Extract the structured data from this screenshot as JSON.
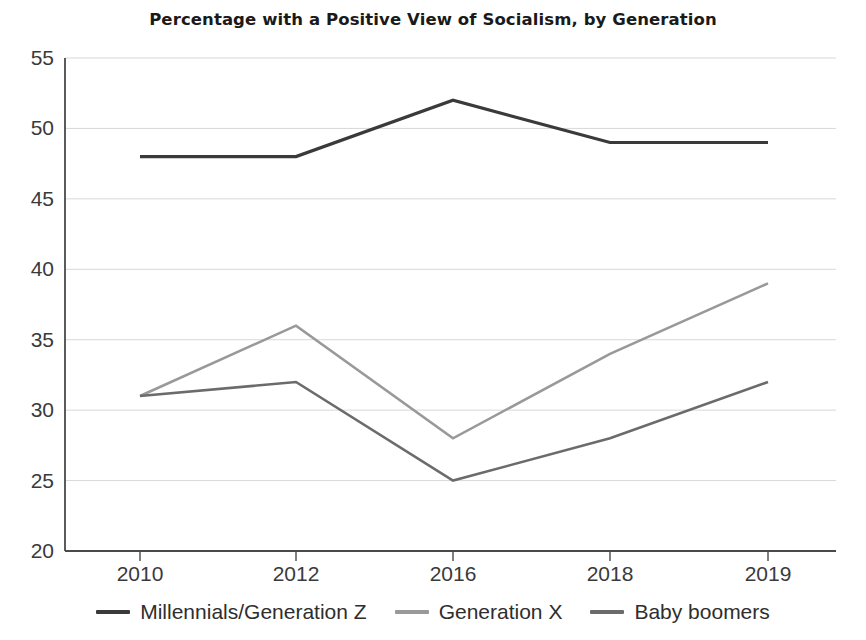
{
  "chart_data": {
    "type": "line",
    "title": "Percentage with a Positive View of Socialism, by Generation",
    "xlabel": "",
    "ylabel": "",
    "categories": [
      "2010",
      "2012",
      "2016",
      "2018",
      "2019"
    ],
    "series": [
      {
        "name": "Millennials/Generation Z",
        "color": "#3a3a3a",
        "values": [
          48,
          48,
          52,
          49,
          49
        ]
      },
      {
        "name": "Generation X",
        "color": "#999999",
        "values": [
          31,
          36,
          28,
          34,
          39
        ]
      },
      {
        "name": "Baby boomers",
        "color": "#6b6b6b",
        "values": [
          31,
          32,
          25,
          28,
          32
        ]
      }
    ],
    "ylim": [
      20,
      55
    ],
    "yticks": [
      20,
      25,
      30,
      35,
      40,
      45,
      50,
      55
    ],
    "ytick_labels": [
      "20",
      "25",
      "30",
      "35",
      "40",
      "45",
      "50",
      "55"
    ],
    "xtick_labels": [
      "2010",
      "2012",
      "2016",
      "2018",
      "2019"
    ],
    "grid": "horizontal",
    "grid_color": "#d8d8d8",
    "axis_color": "#4a4a4a",
    "legend_position": "bottom",
    "background": "#ffffff"
  }
}
